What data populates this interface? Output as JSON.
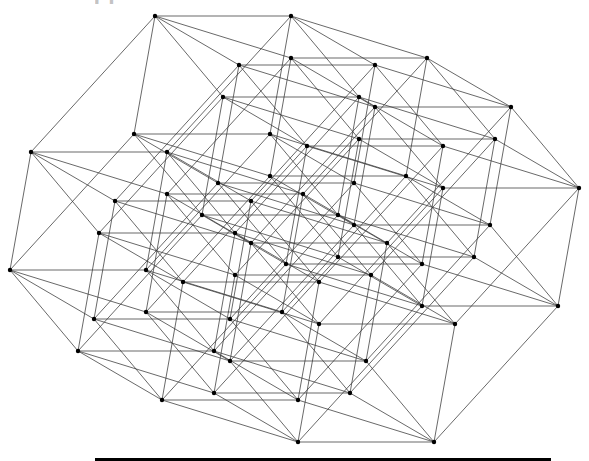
{
  "diagram": {
    "type": "hypercube-projection",
    "dimensions": 6,
    "vertex_count": 64,
    "edge_count": 192,
    "title_fragment": "ДИАГРАММА ГИПЕРКУБА",
    "origin": [
      155,
      16
    ],
    "basis": [
      [
        136,
        0
      ],
      [
        -124,
        136
      ],
      [
        -21,
        118
      ],
      [
        68,
        81
      ],
      [
        84,
        49
      ],
      [
        136,
        42
      ]
    ],
    "colors": {
      "edge": "#3a3a3a",
      "vertex": "#000000",
      "background": "#ffffff",
      "bar": "#000000"
    },
    "edge_width": 0.9,
    "vertex_radius": 2.2
  },
  "footer": {
    "bar_visible": true
  }
}
